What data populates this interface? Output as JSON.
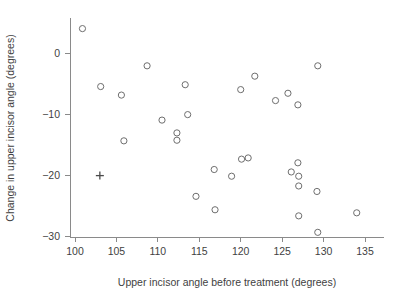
{
  "chart_data": {
    "type": "scatter",
    "title": "",
    "xlabel": "Upper incisor angle before treatment (degrees)",
    "ylabel": "Change in upper incisor angle (degrees)",
    "xlim": [
      98.5,
      136.5
    ],
    "ylim": [
      -31.5,
      6.5
    ],
    "xticks": [
      100,
      105,
      110,
      115,
      120,
      125,
      130,
      135
    ],
    "xticklabels": [
      "100",
      "105",
      "110",
      "115",
      "120",
      "125",
      "130",
      "135"
    ],
    "yticks": [
      0,
      -10,
      -20,
      -30
    ],
    "yticklabels": [
      "0",
      "-10",
      "-20",
      "-30"
    ],
    "grid": false,
    "legend": false,
    "series": [
      {
        "name": "patients",
        "marker": "open-circle",
        "color": "#6e6e6e",
        "points": [
          {
            "x": 100.9,
            "y": 4.0
          },
          {
            "x": 103.1,
            "y": -5.5
          },
          {
            "x": 105.6,
            "y": -6.9
          },
          {
            "x": 105.9,
            "y": -14.4
          },
          {
            "x": 108.7,
            "y": -2.1
          },
          {
            "x": 110.5,
            "y": -11.0
          },
          {
            "x": 112.3,
            "y": -13.1
          },
          {
            "x": 112.3,
            "y": -14.3
          },
          {
            "x": 113.3,
            "y": -5.2
          },
          {
            "x": 113.6,
            "y": -10.1
          },
          {
            "x": 114.6,
            "y": -23.5
          },
          {
            "x": 116.8,
            "y": -19.1
          },
          {
            "x": 116.9,
            "y": -25.7
          },
          {
            "x": 118.9,
            "y": -20.2
          },
          {
            "x": 120.0,
            "y": -6.0
          },
          {
            "x": 120.1,
            "y": -17.4
          },
          {
            "x": 120.9,
            "y": -17.2
          },
          {
            "x": 121.7,
            "y": -3.8
          },
          {
            "x": 124.2,
            "y": -7.8
          },
          {
            "x": 125.7,
            "y": -6.6
          },
          {
            "x": 126.1,
            "y": -19.5
          },
          {
            "x": 126.9,
            "y": -8.5
          },
          {
            "x": 126.9,
            "y": -18.0
          },
          {
            "x": 127.0,
            "y": -20.2
          },
          {
            "x": 127.0,
            "y": -21.8
          },
          {
            "x": 127.0,
            "y": -26.7
          },
          {
            "x": 129.3,
            "y": -2.1
          },
          {
            "x": 129.2,
            "y": -22.7
          },
          {
            "x": 129.3,
            "y": -29.4
          },
          {
            "x": 134.0,
            "y": -26.2
          }
        ]
      },
      {
        "name": "highlighted",
        "marker": "plus",
        "color": "#4a4a4a",
        "points": [
          {
            "x": 103.0,
            "y": -20.1
          }
        ]
      }
    ]
  }
}
